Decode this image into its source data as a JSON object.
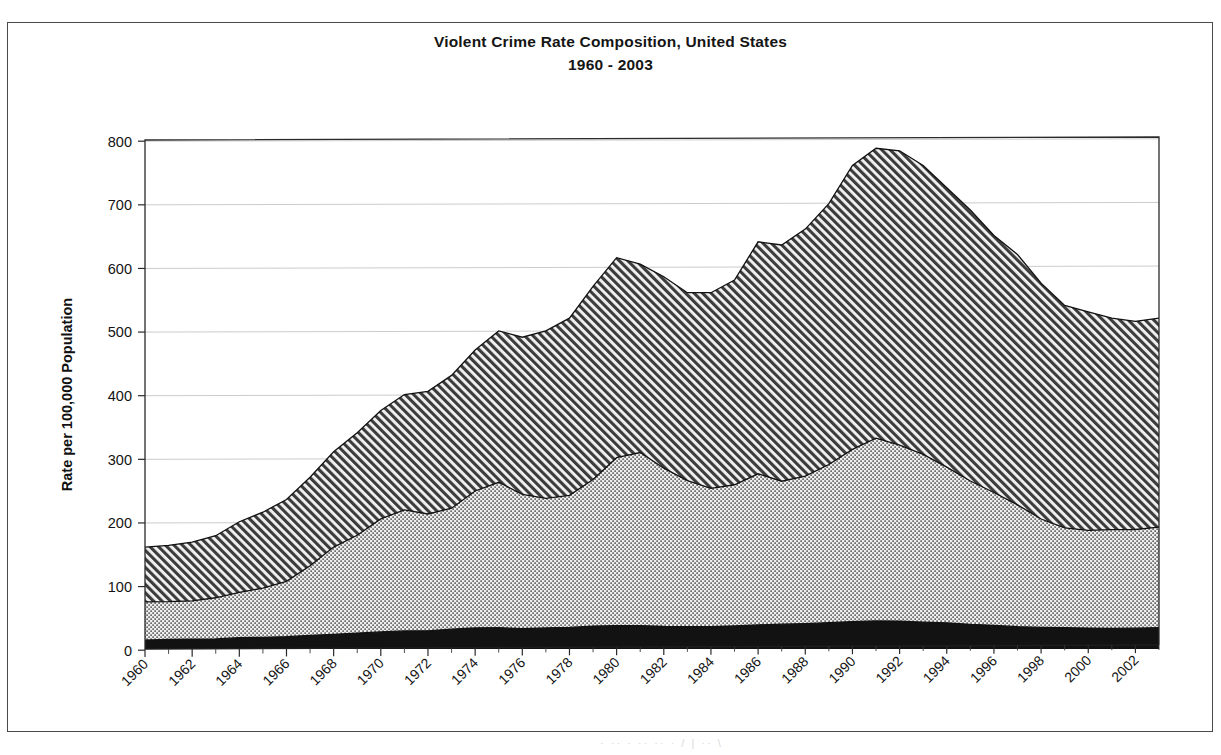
{
  "chart_data": {
    "type": "area",
    "stacked": true,
    "title": "Violent Crime Rate Composition, United States",
    "subtitle": "1960 - 2003",
    "xlabel": "",
    "ylabel": "Rate per 100,000 Population",
    "ylim": [
      0,
      800
    ],
    "ytick_step": 100,
    "yticks": [
      "0",
      "100",
      "200",
      "300",
      "400",
      "500",
      "600",
      "700",
      "800"
    ],
    "xlim": [
      1960,
      2003
    ],
    "xticks": [
      "1960",
      "1962",
      "1964",
      "1966",
      "1968",
      "1970",
      "1972",
      "1974",
      "1976",
      "1978",
      "1980",
      "1982",
      "1984",
      "1986",
      "1988",
      "1990",
      "1992",
      "1994",
      "1996",
      "1998",
      "2000",
      "2002"
    ],
    "xtick_step": 2,
    "xtick_rotation": 45,
    "grid": "horizontal",
    "legend": "none",
    "x": [
      1960,
      1961,
      1962,
      1963,
      1964,
      1965,
      1966,
      1967,
      1968,
      1969,
      1970,
      1971,
      1972,
      1973,
      1974,
      1975,
      1976,
      1977,
      1978,
      1979,
      1980,
      1981,
      1982,
      1983,
      1984,
      1985,
      1986,
      1987,
      1988,
      1989,
      1990,
      1991,
      1992,
      1993,
      1994,
      1995,
      1996,
      1997,
      1998,
      1999,
      2000,
      2001,
      2002,
      2003
    ],
    "series": [
      {
        "name": "murder-rape-series",
        "fill": "solid-black",
        "values": [
          14,
          15,
          15,
          15,
          17,
          17,
          18,
          20,
          22,
          24,
          26,
          28,
          28,
          30,
          32,
          32,
          30,
          31,
          32,
          34,
          35,
          35,
          34,
          33,
          33,
          34,
          36,
          37,
          38,
          39,
          41,
          42,
          42,
          41,
          40,
          38,
          36,
          34,
          33,
          32,
          31,
          31,
          31,
          30
        ]
      },
      {
        "name": "robbery-series",
        "fill": "light-dotted",
        "values": [
          60,
          58,
          58,
          61,
          68,
          72,
          81,
          102,
          131,
          148,
          172,
          188,
          180,
          183,
          209,
          218,
          199,
          191,
          196,
          218,
          251,
          258,
          239,
          217,
          205,
          209,
          226,
          213,
          221,
          234,
          257,
          273,
          264,
          256,
          238,
          221,
          202,
          186,
          166,
          150,
          145,
          149,
          147,
          142
        ]
      },
      {
        "name": "aggravated-assault-series",
        "fill": "diagonal-hatch",
        "values": [
          86,
          87,
          89,
          92,
          106,
          111,
          120,
          130,
          143,
          155,
          165,
          179,
          189,
          201,
          215,
          227,
          233,
          247,
          263,
          287,
          299,
          281,
          289,
          279,
          290,
          303,
          347,
          352,
          370,
          386,
          424,
          433,
          442,
          441,
          427,
          418,
          391,
          382,
          361,
          334,
          324,
          319,
          310,
          295
        ]
      }
    ],
    "totals": [
      160,
      160,
      162,
      168,
      191,
      200,
      219,
      252,
      296,
      327,
      363,
      395,
      397,
      414,
      456,
      477,
      462,
      469,
      491,
      539,
      585,
      574,
      562,
      529,
      528,
      546,
      609,
      602,
      629,
      659,
      722,
      748,
      748,
      738,
      705,
      677,
      629,
      602,
      560,
      516,
      500,
      499,
      488,
      467
    ],
    "display_totals": [
      160,
      163,
      168,
      178,
      200,
      215,
      235,
      270,
      310,
      340,
      375,
      400,
      405,
      430,
      470,
      500,
      490,
      500,
      520,
      570,
      615,
      605,
      585,
      560,
      560,
      580,
      640,
      635,
      660,
      700,
      760,
      787,
      783,
      760,
      725,
      690,
      650,
      620,
      575,
      540,
      530,
      520,
      515,
      520
    ]
  },
  "page": {
    "caption_remnant": "·   ·· ·   ·· ··    ·  /  | ·· \\"
  }
}
